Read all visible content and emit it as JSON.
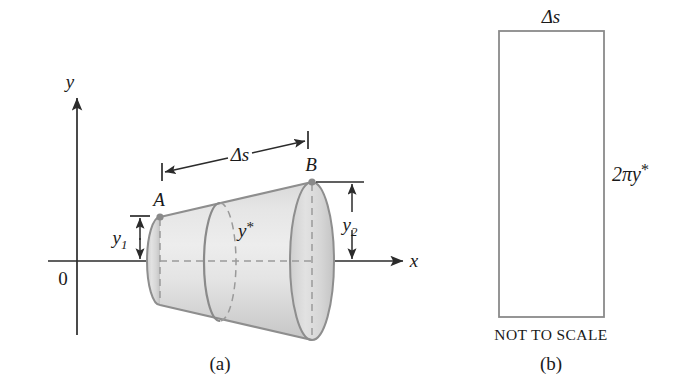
{
  "figure": {
    "panel_a": {
      "caption": "(a)",
      "axis_y_label": "y",
      "axis_x_label": "x",
      "origin_label": "0",
      "point_a_label": "A",
      "point_b_label": "B",
      "delta_s_label": "Δs",
      "y1_base": "y",
      "y1_sub": "1",
      "y2_base": "y",
      "y2_sub": "2",
      "ystar_base": "y",
      "ystar_star": "*",
      "shape": "frustum-of-cone",
      "description": "Frustum generated by revolving segment AB about the x-axis"
    },
    "panel_b": {
      "caption": "(b)",
      "top_label": "Δs",
      "side_base": "2πy",
      "side_star": "*",
      "note": "NOT TO SCALE",
      "axis_x_label": "x",
      "shape": "rectangle",
      "description": "Unrolled lateral surface of the frustum"
    },
    "colors": {
      "ink": "#2b2b2b",
      "surface_light": "#ededed",
      "surface_mid": "#dcdcdc",
      "surface_dark": "#c9c9c9",
      "edge_gray": "#8a8a8a",
      "hidden_gray": "#9a9a9a",
      "background": "#ffffff"
    }
  }
}
